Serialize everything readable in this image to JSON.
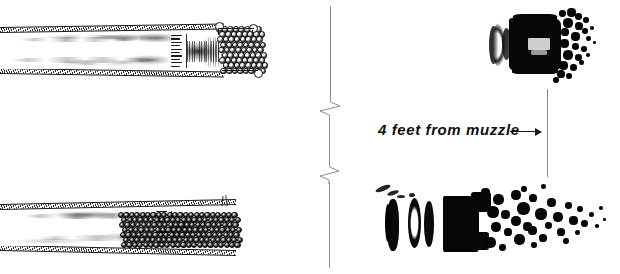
{
  "figure": {
    "background_color": "#ffffff",
    "ink_color": "#101010",
    "rule_color": "#8d8d8d",
    "width": 620,
    "height": 274
  },
  "annotation": {
    "distance_label": "4 feet from muzzle",
    "arrow": "arrow-right",
    "reference_line": "muzzle-distance-reference-line"
  },
  "panels": [
    {
      "id": "top",
      "diagram_label": "barrel-cross-section-top",
      "shot_column_style": "open-pellets-loose-column",
      "photo_label": "shot-pattern-photograph-top",
      "photo_description": "compact dense shot mass with few scattered pellets"
    },
    {
      "id": "bottom",
      "diagram_label": "barrel-cross-section-bottom",
      "shot_column_style": "solid-pellets-compressed-column",
      "photo_label": "shot-pattern-photograph-bottom",
      "photo_description": "elongated dispersed shot string with wide pellet spread"
    }
  ],
  "separator": {
    "label": "vertical-break-line",
    "break_marks": 2
  }
}
